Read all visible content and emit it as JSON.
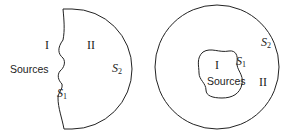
{
  "diagrams": [
    {
      "name": "open-surface",
      "region_inner": "I",
      "region_outer": "II",
      "sources_label": "Sources",
      "surface1": {
        "symbol": "S",
        "sub": "1"
      },
      "surface2": {
        "symbol": "S",
        "sub": "2"
      }
    },
    {
      "name": "closed-surface",
      "region_inner": "I",
      "region_outer": "II",
      "sources_label": "Sources",
      "surface1": {
        "symbol": "S",
        "sub": "1"
      },
      "surface2": {
        "symbol": "S",
        "sub": "2"
      }
    }
  ],
  "colors": {
    "stroke": "#222222",
    "background": "#ffffff"
  }
}
